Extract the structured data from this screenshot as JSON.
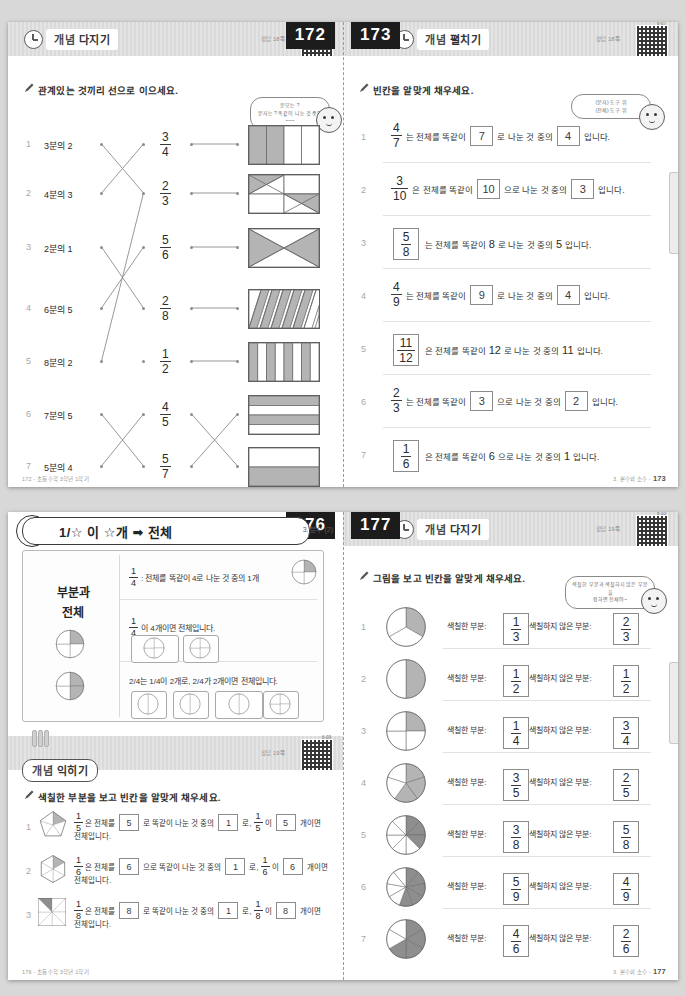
{
  "document": {
    "subject": "3. 분수 (2)",
    "spreads": [
      {
        "left_page": {
          "page_number": "172",
          "banner_title_1": "개념",
          "banner_title_2": "다지기",
          "answer_note": "정답 18쪽",
          "qr_label": "0-06",
          "instruction": "관계있는 것끼리 선으로 이으세요.",
          "bubble_line1": "분모는 ?",
          "bubble_line2": "분자는 ? 똑같이 나눈 것 중의 ~~~",
          "items": [
            {
              "no": "1",
              "label": "3분의 2"
            },
            {
              "no": "2",
              "label": "4분의 3"
            },
            {
              "no": "3",
              "label": "2분의 1"
            },
            {
              "no": "4",
              "label": "6분의 5"
            },
            {
              "no": "5",
              "label": "8분의 2"
            },
            {
              "no": "6",
              "label": "7분의 5"
            },
            {
              "no": "7",
              "label": "5분의 4"
            }
          ],
          "fractions": [
            {
              "num": "3",
              "den": "4"
            },
            {
              "num": "2",
              "den": "3"
            },
            {
              "num": "5",
              "den": "6"
            },
            {
              "num": "2",
              "den": "8"
            },
            {
              "num": "1",
              "den": "2"
            },
            {
              "num": "4",
              "den": "5"
            },
            {
              "num": "5",
              "den": "7"
            }
          ],
          "footer": "172 - 초등수학 3학년 1학기"
        },
        "right_page": {
          "page_number": "173",
          "banner_title_1": "개념",
          "banner_title_2": "펼치기",
          "answer_note": "정답 18쪽",
          "qr_label": "6-07",
          "instruction": "빈칸을 알맞게 채우세요.",
          "bubble_line1": "(분자) 도구 위",
          "bubble_line2": "(전체) 도구 위",
          "rows": [
            {
              "no": "1",
              "frac_num": "4",
              "frac_den": "7",
              "frac_boxed": false,
              "t1": "는 전체를 똑같이",
              "b1": "7",
              "b1_boxed": true,
              "t2": "로 나눈 것 중의",
              "b2": "4",
              "b2_boxed": true,
              "t3": "입니다."
            },
            {
              "no": "2",
              "frac_num": "3",
              "frac_den": "10",
              "frac_boxed": false,
              "t1": "은 전체를 똑같이",
              "b1": "10",
              "b1_boxed": true,
              "t2": "으로 나눈 것 중의",
              "b2": "3",
              "b2_boxed": true,
              "t3": "입니다."
            },
            {
              "no": "3",
              "frac_num": "5",
              "frac_den": "8",
              "frac_boxed": true,
              "t1": "는 전체를 똑같이",
              "b1": "8",
              "b1_boxed": false,
              "t2": "로 나눈 것 중의",
              "b2": "5",
              "b2_boxed": false,
              "t3": "입니다."
            },
            {
              "no": "4",
              "frac_num": "4",
              "frac_den": "9",
              "frac_boxed": false,
              "t1": "는 전체를 똑같이",
              "b1": "9",
              "b1_boxed": true,
              "t2": "로 나눈 것 중의",
              "b2": "4",
              "b2_boxed": true,
              "t3": "입니다."
            },
            {
              "no": "5",
              "frac_num": "11",
              "frac_den": "12",
              "frac_boxed": true,
              "t1": "은 전체를 똑같이",
              "b1": "12",
              "b1_boxed": false,
              "t2": "로 나눈 것 중의",
              "b2": "11",
              "b2_boxed": false,
              "t3": "입니다."
            },
            {
              "no": "6",
              "frac_num": "2",
              "frac_den": "3",
              "frac_boxed": false,
              "t1": "는 전체를 똑같이",
              "b1": "3",
              "b1_boxed": true,
              "t2": "으로 나눈 것 중의",
              "b2": "2",
              "b2_boxed": true,
              "t3": "입니다."
            },
            {
              "no": "7",
              "frac_num": "1",
              "frac_den": "6",
              "frac_boxed": true,
              "t1": "은 전체를 똑같이",
              "b1": "6",
              "b1_boxed": false,
              "t2": "으로 나눈 것 중의",
              "b2": "1",
              "b2_boxed": false,
              "t3": "입니다."
            }
          ],
          "footer_sub": "3. 분수와 소수 -",
          "footer_num": "173"
        }
      },
      {
        "left_page": {
          "page_number": "176",
          "concept_badge_1": "개념",
          "concept_badge_2": "쏙쏙",
          "concept_header": "1/☆ 이 ☆개 ➡ 전체",
          "chapter_label": "3. 분수 (2)",
          "card_title_1": "부분과",
          "card_title_2": "전체",
          "line1_a": "1/4",
          "line1_b": ": 전체를 똑같이 4로 나눈 것 중의 1개",
          "line2_a": "1/4",
          "line2_b": "이 4개이면 전체입니다.",
          "line3": "2/4는 1/4이 2개로, 2/4가 2개이면 전체입니다.",
          "practice": {
            "banner_title_1": "개념",
            "banner_title_2": "익히기",
            "answer_note": "정답 19쪽",
            "qr_label": "6-09",
            "instruction": "색칠한 부분을 보고 빈칸을 알맞게 채우세요.",
            "rows": [
              {
                "no": "1",
                "shape": "pentagon",
                "parts": 5,
                "shaded": 1,
                "fa_n": "1",
                "fa_d": "5",
                "t1": "은 전체를",
                "b1": "5",
                "t2": "로 똑같이 나눈 것 중의",
                "b2": "1",
                "t3": "로,",
                "fb_n": "1",
                "fb_d": "5",
                "t4": "이",
                "b3": "5",
                "t5": "개이면",
                "t6": "전체입니다."
              },
              {
                "no": "2",
                "shape": "hexagon",
                "parts": 6,
                "shaded": 1,
                "fa_n": "1",
                "fa_d": "6",
                "t1": "은 전체를",
                "b1": "6",
                "t2": "으로 똑같이 나눈 것 중의",
                "b2": "1",
                "t3": "로,",
                "fb_n": "1",
                "fb_d": "6",
                "t4": "이",
                "b3": "6",
                "t5": "개이면",
                "t6": "전체입니다."
              },
              {
                "no": "3",
                "shape": "square",
                "parts": 8,
                "shaded": 1,
                "fa_n": "1",
                "fa_d": "8",
                "t1": "은 전체를",
                "b1": "8",
                "t2": "로 똑같이 나눈 것 중의",
                "b2": "1",
                "t3": "로,",
                "fb_n": "1",
                "fb_d": "8",
                "t4": "이",
                "b3": "8",
                "t5": "개이면",
                "t6": "전체입니다."
              }
            ]
          },
          "footer": "176 - 초등수학 3학년 1학기"
        },
        "right_page": {
          "page_number": "177",
          "banner_title_1": "개념",
          "banner_title_2": "다지기",
          "answer_note": "정답 19쪽",
          "qr_label": "6-10",
          "instruction": "그림을 보고 빈칸을 알맞게 채우세요.",
          "bubble_line1": "색칠한 부분과 색칠하지 않은 부분을",
          "bubble_line2": "합하면 전체야~",
          "label_shaded": "색칠한 부분:",
          "label_unshaded": "색칠하지 않은 부분:",
          "rows": [
            {
              "no": "1",
              "parts": 3,
              "shaded": 1,
              "sn": "1",
              "sd": "3",
              "un": "2",
              "ud": "3"
            },
            {
              "no": "2",
              "parts": 2,
              "shaded": 1,
              "sn": "1",
              "sd": "2",
              "un": "1",
              "ud": "2"
            },
            {
              "no": "3",
              "parts": 4,
              "shaded": 1,
              "sn": "1",
              "sd": "4",
              "un": "3",
              "ud": "4"
            },
            {
              "no": "4",
              "parts": 5,
              "shaded": 3,
              "sn": "3",
              "sd": "5",
              "un": "2",
              "ud": "5"
            },
            {
              "no": "5",
              "parts": 8,
              "shaded": 3,
              "sn": "3",
              "sd": "8",
              "un": "5",
              "ud": "8"
            },
            {
              "no": "6",
              "parts": 9,
              "shaded": 5,
              "sn": "5",
              "sd": "9",
              "un": "4",
              "ud": "9"
            },
            {
              "no": "7",
              "parts": 6,
              "shaded": 4,
              "sn": "4",
              "sd": "6",
              "un": "2",
              "ud": "6"
            }
          ],
          "footer_sub": "3. 분수와 소수 -",
          "footer_num": "177"
        }
      }
    ]
  },
  "colors": {
    "shade_gray": "#b4b4b4",
    "shade_dark": "#8e8e8e",
    "ink": "#2b2b2b",
    "rule": "#e2e2e2"
  }
}
